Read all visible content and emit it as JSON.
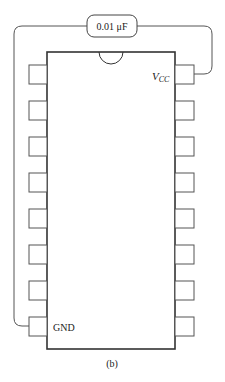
{
  "diagram": {
    "type": "ic-pinout-with-decoupling-capacitor",
    "capacitor": {
      "label": "0.01 μF"
    },
    "chip": {
      "pins_per_side": 8,
      "vcc_label": {
        "main": "V",
        "sub": "CC"
      },
      "gnd_label": "GND"
    },
    "caption": "(b)",
    "colors": {
      "line": "#333333",
      "wire": "#555555",
      "background": "#ffffff"
    }
  }
}
